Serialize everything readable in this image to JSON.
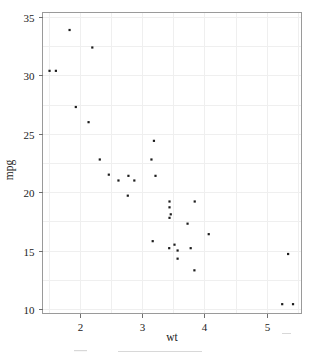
{
  "figure": {
    "background_color": "#ffffff",
    "frame_color": "#9a9a9a",
    "grid_color": "#efefef",
    "marker_color": "#1c1c1c"
  },
  "chart_data": {
    "type": "scatter",
    "title": "",
    "xlabel": "wt",
    "ylabel": "mpg",
    "xlim": [
      1.4,
      5.56
    ],
    "ylim": [
      9.6,
      35.4
    ],
    "xticks": [
      2,
      3,
      4,
      5
    ],
    "yticks": [
      10,
      15,
      20,
      25,
      30,
      35
    ],
    "xtick_labels": [
      "2",
      "3",
      "4",
      "5"
    ],
    "ytick_labels": [
      "10",
      "15",
      "20",
      "25",
      "30",
      "35"
    ],
    "x_minor_gridlines": [
      1.5,
      2.5,
      3.5,
      4.5,
      5.5
    ],
    "y_minor_gridlines": [
      12.5,
      17.5,
      22.5,
      27.5,
      32.5
    ],
    "grid": true,
    "legend": null,
    "marker": "filled-square",
    "marker_size": 2.2,
    "x": [
      2.62,
      2.875,
      2.32,
      3.215,
      3.44,
      3.46,
      3.57,
      3.19,
      3.15,
      3.44,
      3.44,
      4.07,
      3.73,
      3.78,
      5.25,
      5.424,
      5.345,
      2.2,
      1.615,
      1.835,
      2.465,
      3.52,
      3.435,
      3.84,
      3.845,
      1.935,
      2.14,
      1.513,
      3.17,
      2.77,
      3.57,
      2.78
    ],
    "y": [
      21.0,
      21.0,
      22.8,
      21.4,
      18.7,
      18.1,
      14.3,
      24.4,
      22.8,
      19.2,
      17.8,
      16.4,
      17.3,
      15.2,
      10.4,
      10.4,
      14.7,
      32.4,
      30.4,
      33.9,
      21.5,
      15.5,
      15.2,
      13.3,
      19.2,
      27.3,
      26.0,
      30.4,
      15.8,
      19.7,
      15.0,
      21.4
    ]
  }
}
